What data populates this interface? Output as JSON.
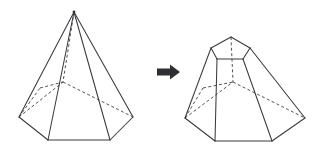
{
  "diagram": {
    "background_color": "#ffffff",
    "stroke_color": "#3a3a3f",
    "hidden_stroke_color": "#4a4a50",
    "arrow_color": "#2e2e33",
    "labels": {
      "left_figure": "hexagonal pyramid",
      "right_figure": "hexagonal frustum",
      "arrow": "transforms into"
    },
    "arrow": {
      "icon": "arrow-right-icon",
      "glyph": "→",
      "x1": 157,
      "y1": 72,
      "x2": 180,
      "y2": 72
    },
    "left_figure": {
      "name": "hexagonal-pyramid",
      "type": "pyramid",
      "base_sides": 6,
      "apex": {
        "x": 74,
        "y": 12
      },
      "base_vertices": [
        {
          "id": "back",
          "x": 63,
          "y": 82,
          "hidden": true
        },
        {
          "id": "mid-right",
          "x": 133,
          "y": 117,
          "hidden": false
        },
        {
          "id": "front-right",
          "x": 110,
          "y": 140,
          "hidden": false
        },
        {
          "id": "front-left",
          "x": 48,
          "y": 140,
          "hidden": false
        },
        {
          "id": "mid-left",
          "x": 19,
          "y": 117,
          "hidden": false
        },
        {
          "id": "back-left",
          "x": 40,
          "y": 88,
          "hidden": true
        }
      ],
      "visible_base_edges": [
        [
          133,
          117,
          110,
          140
        ],
        [
          110,
          140,
          48,
          140
        ],
        [
          48,
          140,
          19,
          117
        ]
      ],
      "hidden_base_edges": [
        [
          19,
          117,
          63,
          82
        ],
        [
          63,
          82,
          133,
          117
        ]
      ],
      "visible_lateral_edges": [
        [
          74,
          12,
          19,
          117
        ],
        [
          74,
          12,
          48,
          140
        ],
        [
          74,
          12,
          110,
          140
        ],
        [
          74,
          12,
          133,
          117
        ]
      ],
      "hidden_lateral_edges": [
        [
          74,
          12,
          63,
          82
        ]
      ]
    },
    "right_figure": {
      "name": "hexagonal-frustum",
      "type": "frustum",
      "base_sides": 6,
      "top_vertices": [
        {
          "id": "back",
          "x": 231,
          "y": 37,
          "hidden": true
        },
        {
          "id": "mid-right",
          "x": 250,
          "y": 48,
          "hidden": false
        },
        {
          "id": "front-right",
          "x": 243,
          "y": 59,
          "hidden": false
        },
        {
          "id": "front-left",
          "x": 217,
          "y": 59,
          "hidden": false
        },
        {
          "id": "mid-left",
          "x": 211,
          "y": 48,
          "hidden": false
        },
        {
          "id": "back-left",
          "x": 219,
          "y": 40,
          "hidden": true
        }
      ],
      "bottom_vertices": [
        {
          "id": "back",
          "x": 233,
          "y": 82,
          "hidden": true
        },
        {
          "id": "mid-right",
          "x": 305,
          "y": 118,
          "hidden": false
        },
        {
          "id": "front-right",
          "x": 272,
          "y": 141,
          "hidden": false
        },
        {
          "id": "front-left",
          "x": 215,
          "y": 141,
          "hidden": false
        },
        {
          "id": "mid-left",
          "x": 185,
          "y": 118,
          "hidden": false
        },
        {
          "id": "back-left",
          "x": 203,
          "y": 88,
          "hidden": true
        }
      ],
      "visible_top_edges": [
        [
          211,
          48,
          231,
          37
        ],
        [
          231,
          37,
          250,
          48
        ],
        [
          250,
          48,
          243,
          59
        ],
        [
          243,
          59,
          217,
          59
        ],
        [
          217,
          59,
          211,
          48
        ]
      ],
      "visible_bottom_edges": [
        [
          305,
          118,
          272,
          141
        ],
        [
          272,
          141,
          215,
          141
        ],
        [
          215,
          141,
          185,
          118
        ]
      ],
      "hidden_bottom_edges": [
        [
          185,
          118,
          233,
          82
        ],
        [
          233,
          82,
          305,
          118
        ]
      ],
      "visible_lateral_edges": [
        [
          211,
          48,
          185,
          118
        ],
        [
          217,
          59,
          215,
          141
        ],
        [
          243,
          59,
          272,
          141
        ],
        [
          250,
          48,
          305,
          118
        ]
      ],
      "hidden_lateral_edges": [
        [
          231,
          37,
          233,
          82
        ]
      ]
    }
  }
}
